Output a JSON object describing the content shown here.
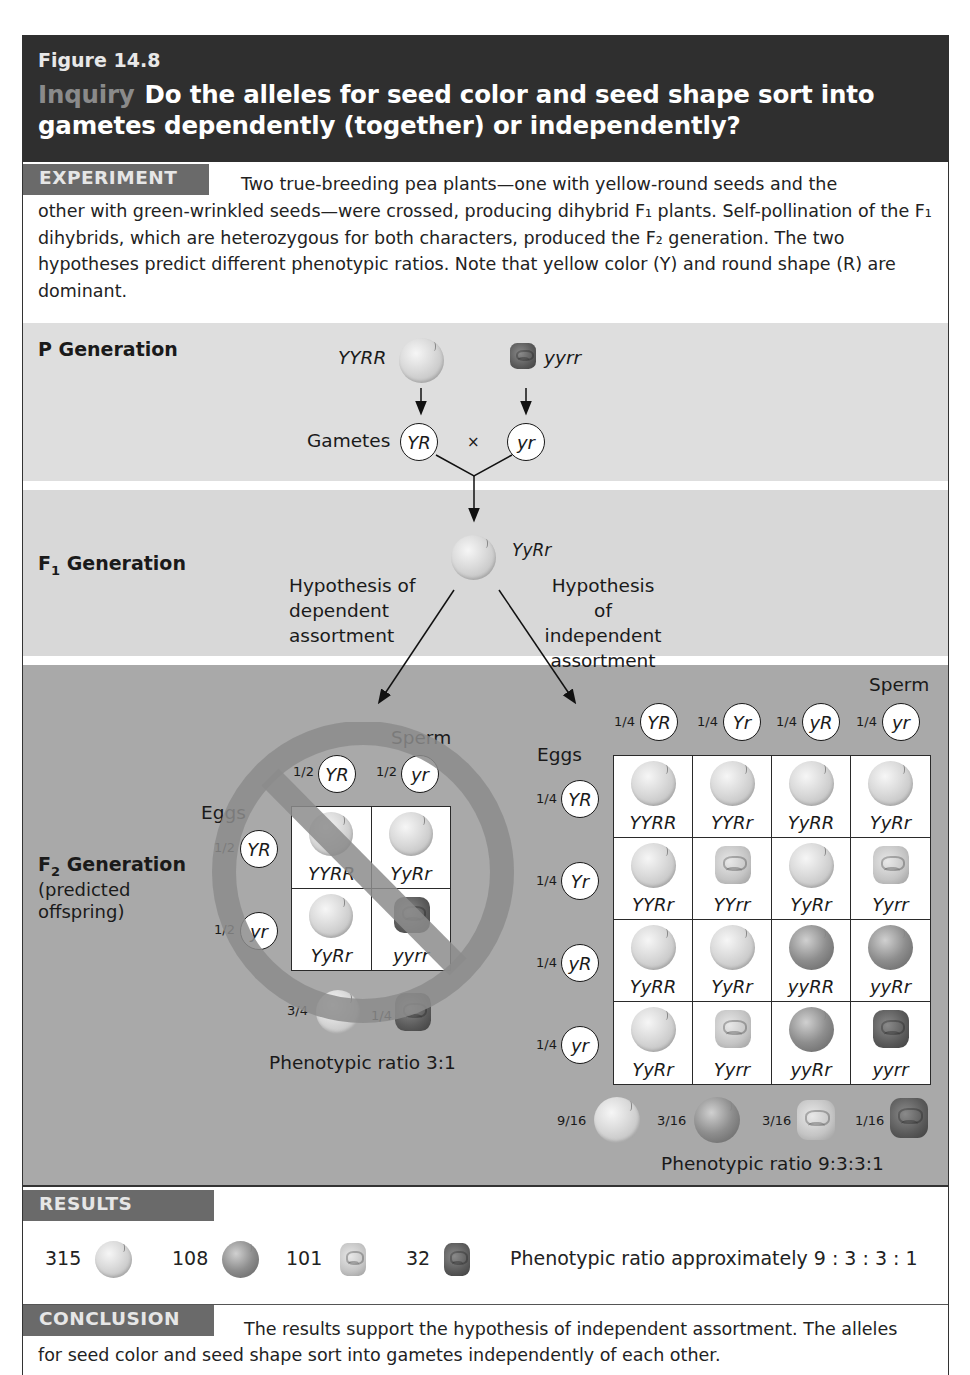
{
  "figure": {
    "number": "Figure 14.8",
    "inquiry_label": "Inquiry",
    "title": "Do the alleles for seed color and seed shape sort into gametes dependently (together) or independently?"
  },
  "experiment": {
    "tag": "EXPERIMENT",
    "text_line1": "Two true-breeding pea plants—one with yellow-round seeds and the",
    "text_rest": "other with green-wrinkled seeds—were crossed, producing dihybrid F₁ plants. Self-pollination of the F₁ dihybrids, which are heterozygous for both characters, produced the F₂ generation. The two hypotheses predict different phenotypic ratios. Note that yellow color (Y) and round shape (R) are dominant."
  },
  "p_generation": {
    "label": "P Generation",
    "parent1_genotype": "YYRR",
    "parent2_genotype": "yyrr",
    "gametes_label": "Gametes",
    "gamete1": "YR",
    "cross_symbol": "×",
    "gamete2": "yr"
  },
  "f1_generation": {
    "label_main": "F",
    "label_sub": "1",
    "label_rest": " Generation",
    "genotype": "YyRr",
    "hypothesis_dependent": [
      "Hypothesis of",
      "dependent",
      "assortment"
    ],
    "hypothesis_independent": [
      "Hypothesis of",
      "independent",
      "assortment"
    ]
  },
  "f2_generation": {
    "label_main": "F",
    "label_sub": "2",
    "label_rest": " Generation",
    "sublabel_line1": "(predicted",
    "sublabel_line2": "offspring)",
    "dependent": {
      "sperm_label": "Sperm",
      "eggs_label": "Eggs",
      "sperm": [
        {
          "frac": "1/2",
          "allele": "YR"
        },
        {
          "frac": "1/2",
          "allele": "yr"
        }
      ],
      "eggs": [
        {
          "frac": "1/2",
          "allele": "YR"
        },
        {
          "frac": "1/2",
          "allele": "yr"
        }
      ],
      "cells": [
        [
          "YYRR",
          "YyRr"
        ],
        [
          "YyRr",
          "yyrr"
        ]
      ],
      "phenotypes": [
        {
          "frac": "3/4",
          "type": "yellow-round"
        },
        {
          "frac": "1/4",
          "type": "green-wrinkled"
        }
      ],
      "ratio_text": "Phenotypic ratio 3:1",
      "rejected": true
    },
    "independent": {
      "sperm_label": "Sperm",
      "eggs_label": "Eggs",
      "sperm": [
        {
          "frac": "1/4",
          "allele": "YR"
        },
        {
          "frac": "1/4",
          "allele": "Yr"
        },
        {
          "frac": "1/4",
          "allele": "yR"
        },
        {
          "frac": "1/4",
          "allele": "yr"
        }
      ],
      "eggs": [
        {
          "frac": "1/4",
          "allele": "YR"
        },
        {
          "frac": "1/4",
          "allele": "Yr"
        },
        {
          "frac": "1/4",
          "allele": "yR"
        },
        {
          "frac": "1/4",
          "allele": "yr"
        }
      ],
      "cells": [
        [
          "YYRR",
          "YYRr",
          "YyRR",
          "YyRr"
        ],
        [
          "YYRr",
          "YYrr",
          "YyRr",
          "Yyrr"
        ],
        [
          "YyRR",
          "YyRr",
          "yyRR",
          "yyRr"
        ],
        [
          "YyRr",
          "Yyrr",
          "yyRr",
          "yyrr"
        ]
      ],
      "phenotypes": [
        {
          "frac": "9/16",
          "type": "yellow-round"
        },
        {
          "frac": "3/16",
          "type": "green-round"
        },
        {
          "frac": "3/16",
          "type": "yellow-wrinkled"
        },
        {
          "frac": "1/16",
          "type": "green-wrinkled"
        }
      ],
      "ratio_text": "Phenotypic ratio 9:3:3:1"
    }
  },
  "results": {
    "tag": "RESULTS",
    "counts": [
      {
        "count": "315",
        "type": "yellow-round"
      },
      {
        "count": "108",
        "type": "green-round"
      },
      {
        "count": "101",
        "type": "yellow-wrinkled"
      },
      {
        "count": "32",
        "type": "green-wrinkled"
      }
    ],
    "ratio_text": "Phenotypic ratio approximately 9 : 3 : 3 : 1"
  },
  "conclusion": {
    "tag": "CONCLUSION",
    "text_line1": "The results support the hypothesis of independent assortment. The alleles",
    "text_line2": "for seed color and seed shape sort into gametes independently of each other."
  },
  "colors": {
    "header_bg": "#2f2f2f",
    "tag_bg": "#6a6a6a",
    "p_band": "#dedede",
    "f1_band": "#d8d8d8",
    "f2_band": "#a9a9a9",
    "no_symbol": "#8c8c8c"
  }
}
